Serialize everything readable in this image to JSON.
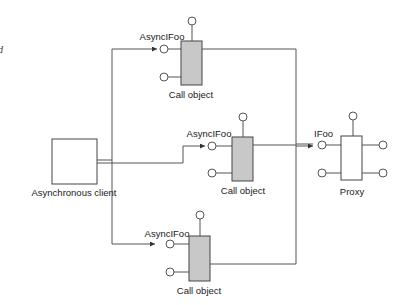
{
  "diagram": {
    "caption_fragment": "d",
    "client": {
      "label": "Asynchronous client"
    },
    "call_objects": [
      {
        "id": "top",
        "interface_label": "AsyncIFoo",
        "label": "Call object"
      },
      {
        "id": "middle",
        "interface_label": "AsyncIFoo",
        "label": "Call object"
      },
      {
        "id": "bottom",
        "interface_label": "AsyncIFoo",
        "label": "Call object"
      }
    ],
    "proxy": {
      "interface_label": "IFoo",
      "label": "Proxy"
    },
    "colors": {
      "line": "#555555",
      "call_object_fill": "#c8c8c8",
      "box_stroke": "#444444",
      "background": "#ffffff"
    }
  }
}
